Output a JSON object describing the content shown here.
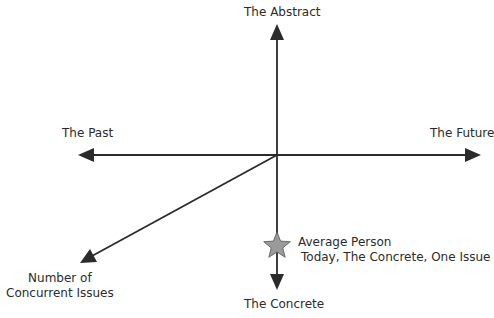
{
  "diagram": {
    "type": "axes-diagram",
    "colors": {
      "axis": "#2b2b2b",
      "star_fill": "#9a9a9a",
      "star_stroke": "#555555",
      "text": "#2b2b2b"
    },
    "axes": {
      "up": {
        "label": "The Abstract"
      },
      "down": {
        "label": "The Concrete"
      },
      "left": {
        "label": "The Past"
      },
      "right": {
        "label": "The Future"
      },
      "diagonal": {
        "label_line1": "Number of",
        "label_line2": "Concurrent Issues"
      }
    },
    "marker": {
      "icon": "star-icon",
      "label_line1": "Average Person",
      "label_line2": "Today, The Concrete, One Issue"
    }
  }
}
